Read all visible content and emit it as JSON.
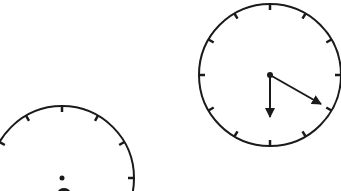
{
  "colors": {
    "background": "#ffffff",
    "stroke": "#1a1a1a"
  },
  "clocks": [
    {
      "id": "clock-left",
      "center": [
        62,
        178
      ],
      "radius": 72,
      "visible_portion": "top half (cropped at bottom of image)",
      "hands": "center pivot visible, hands cropped"
    },
    {
      "id": "clock-right",
      "center": [
        270,
        75
      ],
      "radius": 71,
      "hour_hand": "pointing to 6",
      "minute_hand": "pointing to 4 (20 minutes)",
      "time_shown": "6:20"
    }
  ]
}
